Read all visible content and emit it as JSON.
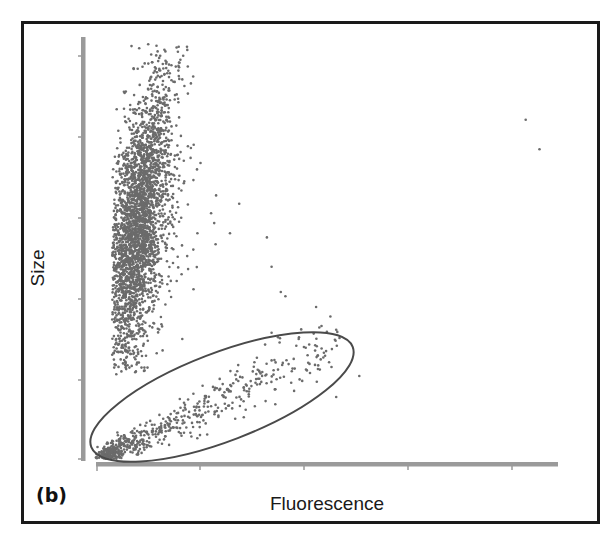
{
  "figure": {
    "panel_label": "(b)",
    "colors": {
      "frame": "#1a1a1a",
      "axis": "#9a9a9a",
      "points": "#6b6b6b",
      "gate": "#4a4a4a",
      "background": "#ffffff"
    }
  },
  "chart_data": {
    "type": "scatter",
    "title": "",
    "xlabel": "Fluorescence",
    "ylabel": "Size",
    "panel": "(b)",
    "grid": false,
    "legend": null,
    "x_tick_labels": [],
    "y_tick_labels": [],
    "x_ticks_count": 5,
    "y_ticks_count": 6,
    "xlim": [
      0,
      1
    ],
    "ylim": [
      0,
      1
    ],
    "note": "Axes unlabeled numerically; coordinates normalized 0-1 (x: fluorescence, y: size).",
    "series": [
      {
        "name": "Non-fluorescent large population",
        "description": "Dense vertical cluster at low fluorescence, high size",
        "center": [
          0.085,
          0.55
        ],
        "spread": [
          0.03,
          0.16
        ],
        "x_range": [
          0.04,
          0.2
        ],
        "y_range": [
          0.25,
          0.99
        ],
        "approx_count": 3000
      },
      {
        "name": "Fluorescent small population (gated)",
        "description": "Diagonal elongated cluster at low size, rising with fluorescence",
        "center": [
          0.13,
          0.04
        ],
        "x_range": [
          0.01,
          0.55
        ],
        "y_range": [
          0.0,
          0.3
        ],
        "approx_count": 600
      },
      {
        "name": "Scattered outliers",
        "points": [
          [
            0.26,
            0.63
          ],
          [
            0.31,
            0.61
          ],
          [
            0.29,
            0.54
          ],
          [
            0.37,
            0.53
          ],
          [
            0.38,
            0.46
          ],
          [
            0.4,
            0.4
          ],
          [
            0.41,
            0.39
          ],
          [
            0.52,
            0.15
          ],
          [
            0.57,
            0.2
          ],
          [
            0.96,
            0.74
          ],
          [
            0.93,
            0.81
          ]
        ]
      }
    ],
    "annotations": [
      {
        "type": "ellipse-gate",
        "description": "Ellipse gate enclosing the fluorescent small-size population",
        "center": [
          0.33,
          0.15
        ],
        "rotation_deg": -22
      }
    ]
  }
}
